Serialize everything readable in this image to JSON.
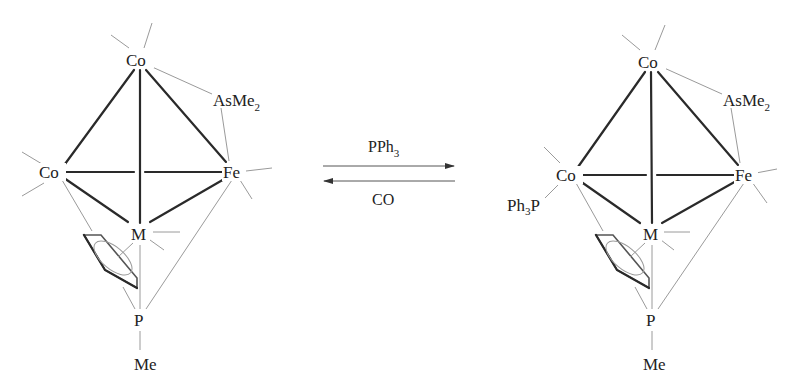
{
  "diagram": {
    "type": "chemical-reaction-scheme",
    "reactant": {
      "atoms": {
        "co_top": "Co",
        "co_left": "Co",
        "fe": "Fe",
        "m": "M",
        "p": "P",
        "p_substituent": "Me",
        "bridging_ligand": "AsMe",
        "bridging_ligand_sub": "2"
      }
    },
    "arrows": {
      "forward_reagent": "PPh",
      "forward_reagent_sub": "3",
      "reverse_reagent": "CO"
    },
    "product": {
      "atoms": {
        "co_top": "Co",
        "co_left": "Co",
        "fe": "Fe",
        "m": "M",
        "p": "P",
        "p_substituent": "Me",
        "bridging_ligand": "AsMe",
        "bridging_ligand_sub": "2",
        "phosphine_ligand_prefix": "Ph",
        "phosphine_ligand_sub": "3",
        "phosphine_ligand_suffix": "P"
      }
    },
    "colors": {
      "heavy_bond": "#2a2a2a",
      "light_bond": "#9a9a9a",
      "text": "#222222"
    }
  }
}
